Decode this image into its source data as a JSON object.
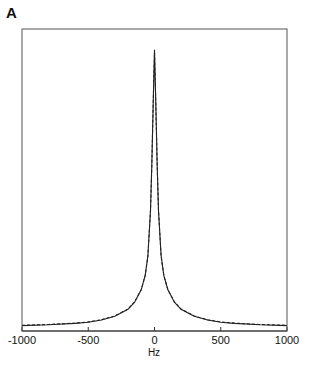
{
  "chart_data": {
    "type": "line",
    "panel_label": "A",
    "title": "",
    "xlabel": "Hz",
    "ylabel": "",
    "xlim": [
      -1000,
      1000
    ],
    "ylim": [
      0,
      1
    ],
    "grid": false,
    "legend": null,
    "x_ticks": [
      "-1000",
      "-500",
      "0",
      "500",
      "1000"
    ],
    "x_tick_values": [
      -1000,
      -500,
      0,
      500,
      1000
    ],
    "series": [
      {
        "name": "spectrum (solid)",
        "style": "solid",
        "x": [
          -1000,
          -800,
          -600,
          -500,
          -400,
          -300,
          -200,
          -150,
          -100,
          -70,
          -50,
          -30,
          -20,
          -10,
          0,
          10,
          20,
          30,
          50,
          70,
          100,
          150,
          200,
          300,
          400,
          500,
          600,
          800,
          1000
        ],
        "y": [
          0.012,
          0.015,
          0.02,
          0.024,
          0.032,
          0.045,
          0.07,
          0.095,
          0.14,
          0.19,
          0.26,
          0.42,
          0.58,
          0.8,
          0.99,
          0.8,
          0.58,
          0.42,
          0.26,
          0.19,
          0.14,
          0.095,
          0.07,
          0.045,
          0.032,
          0.024,
          0.02,
          0.015,
          0.012
        ]
      },
      {
        "name": "fit (dashed)",
        "style": "dashed",
        "x": [
          -1000,
          -800,
          -600,
          -500,
          -400,
          -300,
          -200,
          -150,
          -100,
          -70,
          -50,
          -30,
          -20,
          -10,
          0,
          10,
          20,
          30,
          50,
          70,
          100,
          150,
          200,
          300,
          400,
          500,
          600,
          800,
          1000
        ],
        "y": [
          0.013,
          0.016,
          0.021,
          0.025,
          0.033,
          0.046,
          0.071,
          0.096,
          0.14,
          0.19,
          0.26,
          0.42,
          0.58,
          0.8,
          0.98,
          0.8,
          0.58,
          0.42,
          0.26,
          0.19,
          0.14,
          0.096,
          0.071,
          0.046,
          0.033,
          0.025,
          0.021,
          0.016,
          0.013
        ]
      }
    ]
  }
}
